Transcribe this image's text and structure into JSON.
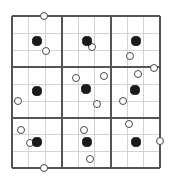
{
  "figure": {
    "kind": "grid-point-diagram",
    "canvas": {
      "width": 174,
      "height": 187
    },
    "background_color": "#ffffff"
  },
  "grid": {
    "left": 12,
    "top": 16,
    "right": 160,
    "bottom": 168,
    "blocks_x": 3,
    "blocks_y": 3,
    "cells_per_block": 3,
    "block_boundaries_x": [
      12,
      62,
      111,
      160
    ],
    "block_boundaries_y": [
      16,
      67,
      118,
      168
    ],
    "minor_lines_x": [
      28.7,
      45.3,
      78.3,
      94.7,
      127.3,
      143.7
    ],
    "minor_lines_y": [
      33,
      50,
      84,
      101,
      134.7,
      151.3
    ],
    "major_line_color": "#545454",
    "minor_line_color": "#c8c8c8",
    "major_line_width": 1.6,
    "minor_line_width": 0.8
  },
  "markers": {
    "filled_color": "#1a1a1a",
    "open_fill_color": "#ffffff",
    "open_stroke_color": "#4a4a4a",
    "filled_radius": 4.6,
    "open_radius": 4.4,
    "filled_count": 9,
    "open_count": 17,
    "total_count": 26,
    "filled_points": [
      {
        "id": "filled-r1c1",
        "cx": 37,
        "cy": 41
      },
      {
        "id": "filled-r1c2",
        "cx": 87,
        "cy": 41
      },
      {
        "id": "filled-r1c3",
        "cx": 136,
        "cy": 41
      },
      {
        "id": "filled-r2c1",
        "cx": 37,
        "cy": 91
      },
      {
        "id": "filled-r2c2",
        "cx": 86,
        "cy": 89
      },
      {
        "id": "filled-r2c3",
        "cx": 135,
        "cy": 90
      },
      {
        "id": "filled-r3c1",
        "cx": 37,
        "cy": 142
      },
      {
        "id": "filled-r3c2",
        "cx": 87,
        "cy": 142
      },
      {
        "id": "filled-r3c3",
        "cx": 136,
        "cy": 142
      }
    ],
    "open_points": [
      {
        "id": "open-top-edge",
        "cx": 44,
        "cy": 16
      },
      {
        "id": "open-r1c1-lower",
        "cx": 46,
        "cy": 51
      },
      {
        "id": "open-r1c2-below",
        "cx": 92,
        "cy": 47
      },
      {
        "id": "open-r1c3-lower",
        "cx": 130,
        "cy": 56
      },
      {
        "id": "open-right-edge-upper",
        "cx": 154,
        "cy": 68
      },
      {
        "id": "open-r2c2-upper-left",
        "cx": 76,
        "cy": 78
      },
      {
        "id": "open-r2c2-upper-right",
        "cx": 104,
        "cy": 76
      },
      {
        "id": "open-r2c3-upper",
        "cx": 138,
        "cy": 74
      },
      {
        "id": "open-left-edge-mid",
        "cx": 18,
        "cy": 101
      },
      {
        "id": "open-r2c2-lower",
        "cx": 97,
        "cy": 104
      },
      {
        "id": "open-r2c3-lower",
        "cx": 123,
        "cy": 101
      },
      {
        "id": "open-r3c1-upper",
        "cx": 21,
        "cy": 130
      },
      {
        "id": "open-r3c2-upper",
        "cx": 84,
        "cy": 130
      },
      {
        "id": "open-r3c3-upper",
        "cx": 129,
        "cy": 124
      },
      {
        "id": "open-r3c1-left-of-filled",
        "cx": 30,
        "cy": 143
      },
      {
        "id": "open-right-edge-lower",
        "cx": 160,
        "cy": 141
      },
      {
        "id": "open-r3c2-below",
        "cx": 90,
        "cy": 159
      },
      {
        "id": "open-bottom-edge",
        "cx": 44,
        "cy": 168
      }
    ]
  },
  "legend": {
    "filled_label": "filled circle",
    "open_label": "open circle"
  }
}
